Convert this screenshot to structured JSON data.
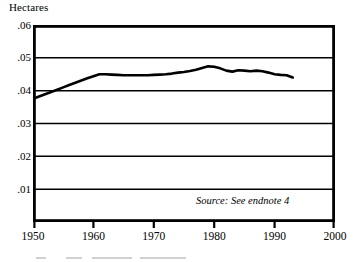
{
  "chart_data": {
    "type": "line",
    "title": "",
    "subtitle": "",
    "xlabel": "",
    "ylabel": "Hectares",
    "xlim": [
      1950,
      2000
    ],
    "ylim": [
      0,
      0.06
    ],
    "grid": true,
    "grid_axis": "y",
    "legend": false,
    "legend_position": "none",
    "x_ticks": [
      1950,
      1960,
      1970,
      1980,
      1990,
      2000
    ],
    "x_tick_labels": [
      "1950",
      "1960",
      "1970",
      "1980",
      "1990",
      "2000"
    ],
    "y_ticks": [
      0.01,
      0.02,
      0.03,
      0.04,
      0.05,
      0.06
    ],
    "y_tick_labels": [
      ".01",
      ".02",
      ".03",
      ".04",
      ".05",
      ".06"
    ],
    "annotations": [
      {
        "text": "Source: See endnote 4",
        "style": "italic",
        "x": 1981,
        "y": 0.0085
      }
    ],
    "series": [
      {
        "name": "Grainland area per person",
        "color": "#000000",
        "line_width": 2.6,
        "x": [
          1950,
          1951,
          1952,
          1953,
          1954,
          1955,
          1956,
          1957,
          1958,
          1959,
          1960,
          1961,
          1962,
          1963,
          1964,
          1965,
          1966,
          1967,
          1968,
          1969,
          1970,
          1971,
          1972,
          1973,
          1974,
          1975,
          1976,
          1977,
          1978,
          1979,
          1980,
          1981,
          1982,
          1983,
          1984,
          1985,
          1986,
          1987,
          1988,
          1989,
          1990,
          1991,
          1992,
          1993
        ],
        "values": [
          0.0375,
          0.0382,
          0.0389,
          0.0396,
          0.0403,
          0.041,
          0.0417,
          0.0424,
          0.0431,
          0.0438,
          0.0444,
          0.045,
          0.045,
          0.0449,
          0.0448,
          0.0447,
          0.0447,
          0.0447,
          0.0447,
          0.0447,
          0.0448,
          0.0449,
          0.045,
          0.0452,
          0.0455,
          0.0457,
          0.046,
          0.0464,
          0.0469,
          0.0474,
          0.0473,
          0.0468,
          0.0461,
          0.0458,
          0.0462,
          0.0461,
          0.0459,
          0.0461,
          0.0459,
          0.0455,
          0.045,
          0.0448,
          0.0447,
          0.044
        ]
      }
    ]
  },
  "figure": {
    "y_axis_label": "Hectares",
    "source_note": "Source: See endnote 4"
  }
}
